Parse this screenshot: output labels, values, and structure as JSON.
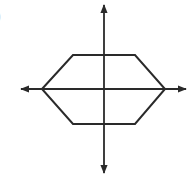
{
  "figure": {
    "label_fragment": ")",
    "stroke_color": "#2a2a2a",
    "background": "#ffffff"
  },
  "axes": {
    "x_axis": {
      "from": [
        21,
        89
      ],
      "to": [
        186,
        89
      ],
      "arrows": "both"
    },
    "y_axis": {
      "from": [
        104,
        5
      ],
      "to": [
        104,
        173
      ],
      "arrows": "both"
    }
  },
  "shape": {
    "type": "hexagon",
    "vertices": [
      [
        42,
        89
      ],
      [
        73,
        55
      ],
      [
        135,
        55
      ],
      [
        165,
        89
      ],
      [
        135,
        124
      ],
      [
        73,
        124
      ]
    ]
  }
}
